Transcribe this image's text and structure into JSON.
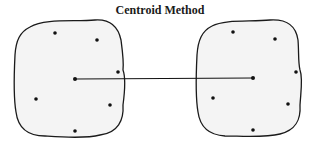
{
  "title": "Centroid Method",
  "colors": {
    "outline": "#1a1a1a",
    "fill": "#f4f4f4",
    "point": "#111111",
    "link": "#111111"
  },
  "clusters": [
    {
      "name": "cluster-left",
      "outline_path": "M30,27 C45,18 75,22 95,20 C110,19 118,26 121,40 C123,55 124,62 123,70 C126,78 125,90 123,105 C124,120 118,133 100,135 C85,139 60,137 45,136 C28,136 18,128 16,112 C13,95 14,75 15,55 C16,40 20,32 30,27 Z",
      "points": [
        [
          55,
          33
        ],
        [
          97,
          40
        ],
        [
          118,
          72
        ],
        [
          36,
          99
        ],
        [
          110,
          105
        ],
        [
          75,
          131
        ]
      ],
      "centroid": [
        75,
        79
      ]
    },
    {
      "name": "cluster-right",
      "outline_path": "M212,26 C225,19 250,22 270,20 C288,19 296,26 298,40 C299,52 298,62 300,70 C303,78 301,90 300,105 C301,120 296,130 280,134 C265,138 240,136 225,136 C208,135 200,127 198,112 C195,95 196,75 197,55 C198,40 202,31 212,26 Z",
      "points": [
        [
          233,
          32
        ],
        [
          275,
          39
        ],
        [
          296,
          72
        ],
        [
          213,
          98
        ],
        [
          288,
          104
        ],
        [
          253,
          130
        ]
      ],
      "centroid": [
        253,
        78
      ]
    }
  ],
  "link": {
    "from": [
      75,
      79
    ],
    "to": [
      253,
      78
    ]
  }
}
